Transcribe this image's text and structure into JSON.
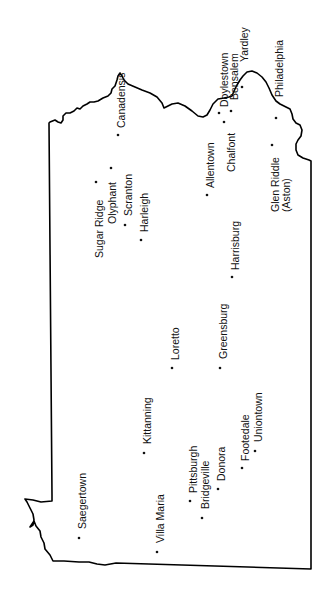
{
  "map": {
    "region": "Pennsylvania",
    "orientation": "rotated 90° counter-clockwise",
    "border_color": "#000000",
    "cities": [
      {
        "name": "Canadensis",
        "dot": [
          118,
          135
        ],
        "label": [
          125,
          127
        ]
      },
      {
        "name": "Doylestown",
        "dot": [
          219,
          113
        ],
        "label": [
          226,
          108
        ]
      },
      {
        "name": "Bensalem",
        "dot": [
          231,
          111
        ],
        "label": [
          238,
          100
        ]
      },
      {
        "name": "Yardley",
        "dot": [
          242,
          87
        ],
        "label": [
          248,
          60
        ]
      },
      {
        "name": "Philadelphia",
        "dot": [
          276,
          118
        ],
        "label": [
          282,
          97
        ]
      },
      {
        "name": "Chalfont",
        "dot": [
          224,
          122
        ],
        "label": [
          235,
          171
        ]
      },
      {
        "name": "Allentown",
        "dot": [
          207,
          195
        ],
        "label": [
          214,
          187
        ]
      },
      {
        "name": "Glen Riddle",
        "dot": [
          272,
          145
        ],
        "label": [
          279,
          211
        ]
      },
      {
        "name": "(Aston)",
        "dot": null,
        "label": [
          290,
          212
        ]
      },
      {
        "name": "Sugar Ridge",
        "dot": [
          96,
          182
        ],
        "label": [
          103,
          257
        ]
      },
      {
        "name": "Olyphant",
        "dot": [
          111,
          168
        ],
        "label": [
          116,
          223
        ]
      },
      {
        "name": "Scranton",
        "dot": [
          125,
          225
        ],
        "label": [
          132,
          214
        ]
      },
      {
        "name": "Harleigh",
        "dot": [
          141,
          240
        ],
        "label": [
          148,
          232
        ]
      },
      {
        "name": "Harrisburg",
        "dot": [
          232,
          277
        ],
        "label": [
          239,
          270
        ]
      },
      {
        "name": "Loretto",
        "dot": [
          172,
          368
        ],
        "label": [
          179,
          359
        ]
      },
      {
        "name": "Greensburg",
        "dot": [
          220,
          368
        ],
        "label": [
          227,
          358
        ]
      },
      {
        "name": "Kittanning",
        "dot": [
          144,
          453
        ],
        "label": [
          151,
          443
        ]
      },
      {
        "name": "Saegertown",
        "dot": [
          79,
          538
        ],
        "label": [
          85,
          528
        ]
      },
      {
        "name": "Villa Maria",
        "dot": [
          157,
          552
        ],
        "label": [
          164,
          542
        ]
      },
      {
        "name": "Pittsburgh",
        "dot": [
          190,
          501
        ],
        "label": [
          197,
          492
        ]
      },
      {
        "name": "Bridgeville",
        "dot": [
          202,
          518
        ],
        "label": [
          209,
          508
        ]
      },
      {
        "name": "Donora",
        "dot": [
          218,
          489
        ],
        "label": [
          225,
          481
        ]
      },
      {
        "name": "Footedale",
        "dot": [
          242,
          468
        ],
        "label": [
          249,
          460
        ]
      },
      {
        "name": "Uniontown",
        "dot": [
          255,
          451
        ],
        "label": [
          262,
          441
        ]
      }
    ]
  }
}
